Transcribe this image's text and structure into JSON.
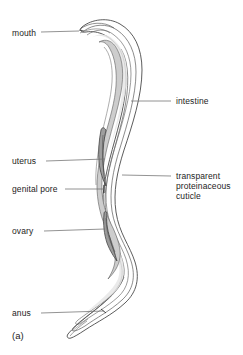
{
  "figure": {
    "panel_letter": "(a)",
    "background_color": "#ffffff",
    "ink_color": "#3a3a3a",
    "fill_color": "#e3e3e3",
    "organ_fill_color": "#cfcfcf",
    "leader_color": "#6b6b6b"
  },
  "labels": [
    {
      "id": "mouth",
      "text": "mouth",
      "x": 12,
      "y": 28,
      "align": "left"
    },
    {
      "id": "intestine",
      "text": "intestine",
      "x": 176,
      "y": 98,
      "align": "left"
    },
    {
      "id": "uterus",
      "text": "uterus",
      "x": 12,
      "y": 157,
      "align": "left"
    },
    {
      "id": "genital-pore",
      "text": "genital pore",
      "x": 12,
      "y": 185,
      "align": "left"
    },
    {
      "id": "cuticle",
      "text": "transparent\nproteinaceous\ncuticle",
      "x": 176,
      "y": 171,
      "align": "left"
    },
    {
      "id": "ovary",
      "text": "ovary",
      "x": 12,
      "y": 227,
      "align": "left"
    },
    {
      "id": "anus",
      "text": "anus",
      "x": 12,
      "y": 309,
      "align": "left"
    }
  ],
  "leader_lines": [
    {
      "id": "mouth-leader",
      "x1": 41,
      "y1": 32,
      "x2": 79,
      "y2": 31
    },
    {
      "id": "intestine-leader",
      "x1": 171,
      "y1": 101,
      "x2": 131,
      "y2": 101
    },
    {
      "id": "uterus-leader",
      "x1": 46,
      "y1": 161,
      "x2": 105,
      "y2": 159
    },
    {
      "id": "genital-pore-leader",
      "x1": 65,
      "y1": 189,
      "x2": 104,
      "y2": 189
    },
    {
      "id": "cuticle-leader",
      "x1": 171,
      "y1": 176,
      "x2": 122,
      "y2": 175
    },
    {
      "id": "ovary-leader",
      "x1": 44,
      "y1": 231,
      "x2": 105,
      "y2": 229
    },
    {
      "id": "anus-leader",
      "x1": 41,
      "y1": 313,
      "x2": 104,
      "y2": 311
    }
  ]
}
